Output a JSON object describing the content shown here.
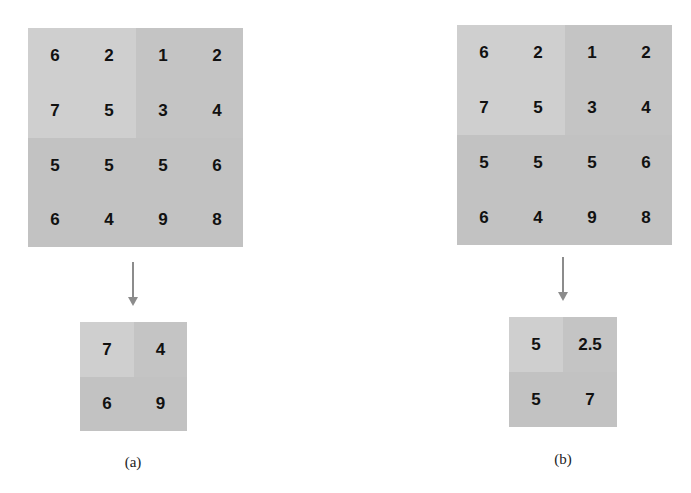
{
  "colors": {
    "light": "#cfcfcf",
    "dark": "#c3c3c3",
    "arrow": "#8c8c8c"
  },
  "panels": [
    {
      "caption": "(a)",
      "operation": "max pooling",
      "input": [
        [
          6,
          2,
          1,
          2
        ],
        [
          7,
          5,
          3,
          4
        ],
        [
          5,
          5,
          5,
          6
        ],
        [
          6,
          4,
          9,
          8
        ]
      ],
      "output": [
        [
          "7",
          "4"
        ],
        [
          "6",
          "9"
        ]
      ]
    },
    {
      "caption": "(b)",
      "operation": "average pooling",
      "input": [
        [
          6,
          2,
          1,
          2
        ],
        [
          7,
          5,
          3,
          4
        ],
        [
          5,
          5,
          5,
          6
        ],
        [
          6,
          4,
          9,
          8
        ]
      ],
      "output": [
        [
          "5",
          "2.5"
        ],
        [
          "5",
          "7"
        ]
      ]
    }
  ]
}
